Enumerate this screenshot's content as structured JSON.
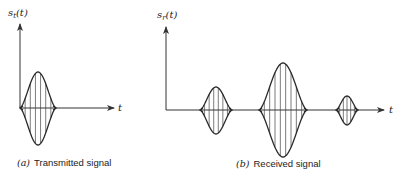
{
  "panel_a": {
    "y_label_main": "s",
    "y_label_sub": "t",
    "y_label_arg": "(t)",
    "x_label": "t",
    "caption_tag": "(a)",
    "caption_text": "Transmitted signal",
    "pulses": [
      {
        "cx": 38,
        "half_width": 18,
        "top": 72,
        "bottom": 145,
        "lines": 6
      }
    ]
  },
  "panel_b": {
    "y_label_main": "s",
    "y_label_sub": "r",
    "y_label_arg": "(t)",
    "x_label": "t",
    "caption_tag": "(b)",
    "caption_text": "Received signal",
    "pulses": [
      {
        "cx": 216,
        "half_width": 16,
        "top": 87,
        "bottom": 134,
        "lines": 6
      },
      {
        "cx": 283,
        "half_width": 24,
        "top": 63,
        "bottom": 157,
        "lines": 8
      },
      {
        "cx": 347,
        "half_width": 11,
        "top": 96,
        "bottom": 125,
        "lines": 5
      }
    ]
  },
  "colors": {
    "ink": "#2a2a2a",
    "background": "#ffffff"
  }
}
